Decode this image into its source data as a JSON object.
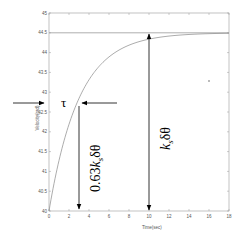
{
  "chart_data": {
    "type": "line",
    "title": "",
    "xlabel": "Time(sec)",
    "ylabel": "Velocity(rad)",
    "xlim": [
      0,
      18
    ],
    "ylim": [
      40,
      45
    ],
    "x_ticks": [
      "0",
      "2",
      "4",
      "6",
      "8",
      "10",
      "12",
      "14",
      "16",
      "18"
    ],
    "y_ticks": [
      "40",
      "40.5",
      "41",
      "41.5",
      "42",
      "42.5",
      "43",
      "43.5",
      "44",
      "44.5",
      "45"
    ],
    "grid": false,
    "series": [
      {
        "name": "first-order step response",
        "model": "y = 40 + 4.5*(1 - exp(-t/3))",
        "x": [
          0,
          1,
          2,
          3,
          4,
          5,
          6,
          8,
          10,
          12,
          14,
          16,
          18
        ],
        "values": [
          40.0,
          41.28,
          42.19,
          42.84,
          43.31,
          43.65,
          43.89,
          44.19,
          44.34,
          44.42,
          44.46,
          44.48,
          44.49
        ]
      },
      {
        "name": "final value asymptote",
        "x": [
          0,
          18
        ],
        "values": [
          44.5,
          44.5
        ]
      }
    ],
    "annotations": [
      {
        "type": "label",
        "text": "τ",
        "x": 3,
        "y": 42.835,
        "note": "time constant, marked with horizontal arrows"
      },
      {
        "type": "vertical-arrow",
        "text": "0.63kₛδθ",
        "x": 3,
        "from": 42.835,
        "to": 40
      },
      {
        "type": "double-arrow",
        "text": "kₛδθ",
        "x": 10,
        "from": 40,
        "to": 44.5
      }
    ]
  },
  "labels": {
    "tau": "τ",
    "ks_label_main": "k",
    "ks_label_sub": "s",
    "ks_label_tail": "δθ",
    "frac_label_head": "0.63",
    "frac_label_k": "k",
    "frac_label_sub": "s",
    "frac_label_tail": "δθ",
    "xlabel": "Time(sec)",
    "ylabel": "Velocity(rad)"
  }
}
